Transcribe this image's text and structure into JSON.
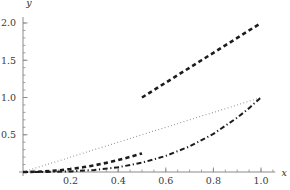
{
  "chart_data": {
    "type": "line",
    "title": "",
    "subtitle": "",
    "xlabel": "x",
    "ylabel": "y",
    "xlim": [
      0,
      1.06
    ],
    "ylim": [
      0,
      2.08
    ],
    "grid": false,
    "legend": "none",
    "x_ticks": [
      0.2,
      0.4,
      0.6,
      0.8,
      1.0
    ],
    "x_tick_labels": [
      "0.2",
      "0.4",
      "0.6",
      "0.8",
      "1.0"
    ],
    "y_ticks": [
      0.5,
      1.0,
      1.5,
      2.0
    ],
    "y_tick_labels": [
      "0.5",
      "1.0",
      "1.5",
      "2.0"
    ],
    "x_minor_step": 0.05,
    "y_minor_step": 0.1,
    "axis_color": "#8a8a8a",
    "series": [
      {
        "name": "dotted-line",
        "style": "dotted",
        "color": "#6f6f6f",
        "width": 1.1,
        "x": [
          0.0,
          0.1,
          0.2,
          0.3,
          0.4,
          0.5,
          0.6,
          0.7,
          0.8,
          0.9,
          1.0
        ],
        "values": [
          0.0,
          0.1,
          0.2,
          0.3,
          0.4,
          0.5,
          0.6,
          0.7,
          0.8,
          0.9,
          1.0
        ]
      },
      {
        "name": "dashed-lower-branch",
        "style": "dashed",
        "color": "#1c1c1c",
        "width": 2.6,
        "x": [
          0.0,
          0.05,
          0.1,
          0.15,
          0.2,
          0.25,
          0.3,
          0.35,
          0.4,
          0.45,
          0.5
        ],
        "values": [
          0.0,
          0.0025,
          0.01,
          0.0225,
          0.04,
          0.0625,
          0.09,
          0.1225,
          0.16,
          0.2025,
          0.25
        ]
      },
      {
        "name": "dashed-upper-branch",
        "style": "dashed",
        "color": "#1c1c1c",
        "width": 2.6,
        "x": [
          0.5,
          0.55,
          0.6,
          0.65,
          0.7,
          0.75,
          0.8,
          0.85,
          0.9,
          0.95,
          1.0
        ],
        "values": [
          1.0,
          1.1,
          1.2,
          1.3,
          1.4,
          1.5,
          1.6,
          1.7,
          1.8,
          1.9,
          2.0
        ]
      },
      {
        "name": "dash-dot-curve",
        "style": "dashdot",
        "color": "#1c1c1c",
        "width": 2.0,
        "x": [
          0.0,
          0.1,
          0.2,
          0.3,
          0.4,
          0.5,
          0.6,
          0.7,
          0.8,
          0.9,
          0.95,
          1.0
        ],
        "values": [
          0.0,
          0.001,
          0.008,
          0.027,
          0.064,
          0.125,
          0.216,
          0.343,
          0.512,
          0.729,
          0.857,
          1.0
        ]
      }
    ]
  }
}
